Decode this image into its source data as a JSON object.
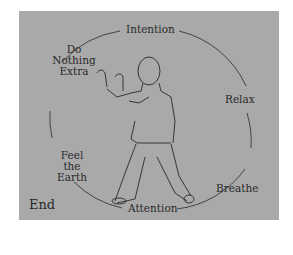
{
  "diagram": {
    "labels": {
      "top": "Intention",
      "right_upper": "Relax",
      "right_lower": "Breathe",
      "bottom": "Attention",
      "left_lower": [
        "Feel",
        "the",
        "Earth"
      ],
      "left_upper": [
        "Do",
        "Nothing",
        "Extra"
      ]
    },
    "corner_label": "End",
    "figure": "tai-chi-figure-standing-hands-raised",
    "colors": {
      "background": "#a9a9a9",
      "line": "#2a2a2a"
    }
  }
}
